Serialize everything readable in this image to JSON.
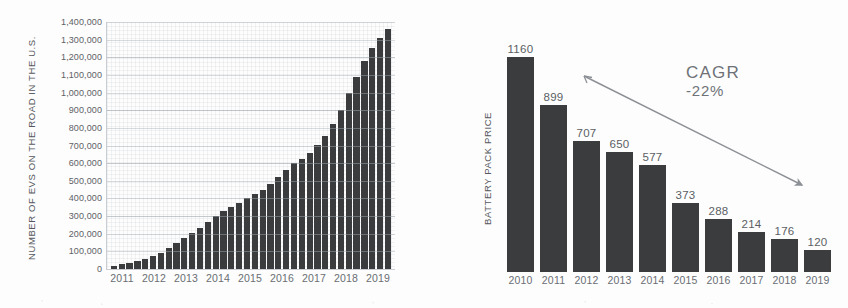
{
  "figure": {
    "background_color": "#fdfdfd",
    "bar_color": "#3a3c3e",
    "text_color": "#5d6166",
    "grid_color": "#bec3c8"
  },
  "chart_data": [
    {
      "type": "bar",
      "id": "ev-on-road",
      "title": "",
      "xlabel": "",
      "ylabel": "NUMBER OF EVS ON THE ROAD IN THE U.S.",
      "ylim": [
        0,
        1400000
      ],
      "grid": true,
      "legend": "none",
      "ytick_labels": [
        "1,400,000",
        "1,300,000",
        "1,200,000",
        "1,100,000",
        "1,000,000",
        "900,000",
        "800,000",
        "700,000",
        "600,000",
        "500,000",
        "400,000",
        "300,000",
        "200,000",
        "100,000",
        "0"
      ],
      "ytick_values": [
        1400000,
        1300000,
        1200000,
        1100000,
        1000000,
        900000,
        800000,
        700000,
        600000,
        500000,
        400000,
        300000,
        200000,
        100000,
        0
      ],
      "categories": [
        "2011",
        "2012",
        "2013",
        "2014",
        "2015",
        "2016",
        "2017",
        "2018",
        "2019"
      ],
      "bar_interval": "quarterly",
      "values": [
        18000,
        26000,
        34000,
        45000,
        58000,
        72000,
        88000,
        120000,
        150000,
        178000,
        205000,
        232000,
        265000,
        298000,
        330000,
        352000,
        375000,
        400000,
        425000,
        450000,
        480000,
        520000,
        560000,
        600000,
        625000,
        660000,
        705000,
        755000,
        820000,
        900000,
        1000000,
        1090000,
        1180000,
        1250000,
        1310000,
        1360000
      ]
    },
    {
      "type": "bar",
      "id": "battery-pack-price",
      "title": "",
      "xlabel": "",
      "ylabel": "BATTERY PACK PRICE",
      "ylim": [
        0,
        1160
      ],
      "grid": false,
      "legend": "none",
      "categories": [
        "2010",
        "2011",
        "2012",
        "2013",
        "2014",
        "2015",
        "2016",
        "2017",
        "2018",
        "2019"
      ],
      "values": [
        1160,
        899,
        707,
        650,
        577,
        373,
        288,
        214,
        176,
        120
      ],
      "data_labels": [
        "1160",
        "899",
        "707",
        "650",
        "577",
        "373",
        "288",
        "214",
        "176",
        "120"
      ],
      "annotations": [
        {
          "id": "cagr",
          "label": "CAGR",
          "value": "-22%",
          "arrow": "downward-trend-arrow"
        }
      ]
    }
  ]
}
